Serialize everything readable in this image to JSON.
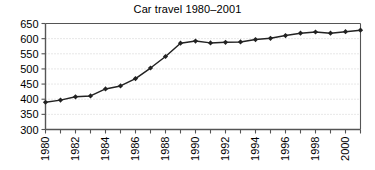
{
  "chart_data": {
    "type": "line",
    "title": "Car travel 1980–2001",
    "xlabel": "",
    "ylabel": "",
    "grid": true,
    "legend": "none",
    "xlim": [
      1980,
      2001
    ],
    "ylim": [
      300,
      650
    ],
    "ytick_labels": [
      "650",
      "600",
      "550",
      "500",
      "450",
      "400",
      "350",
      "300"
    ],
    "ytick_values": [
      650,
      600,
      550,
      500,
      450,
      400,
      350,
      300
    ],
    "xtick_values": [
      1980,
      1981,
      1982,
      1983,
      1984,
      1985,
      1986,
      1987,
      1988,
      1989,
      1990,
      1991,
      1992,
      1993,
      1994,
      1995,
      1996,
      1997,
      1998,
      1999,
      2000,
      2001
    ],
    "xtick_labels": [
      "1980",
      "",
      "1982",
      "",
      "1984",
      "",
      "1986",
      "",
      "1988",
      "",
      "1990",
      "",
      "1992",
      "",
      "1994",
      "",
      "1996",
      "",
      "1998",
      "",
      "2000",
      ""
    ],
    "series": [
      {
        "name": "Car travel",
        "marker": "diamond",
        "color": "#222222",
        "x": [
          1980,
          1981,
          1982,
          1983,
          1984,
          1985,
          1986,
          1987,
          1988,
          1989,
          1990,
          1991,
          1992,
          1993,
          1994,
          1995,
          1996,
          1997,
          1998,
          1999,
          2000,
          2001
        ],
        "values": [
          390,
          397,
          408,
          411,
          434,
          444,
          468,
          503,
          541,
          585,
          592,
          586,
          588,
          589,
          597,
          601,
          610,
          618,
          622,
          618,
          623,
          628
        ]
      }
    ]
  },
  "figure": {
    "background_color": "#ffffff",
    "axis_color": "#555555",
    "grid_color": "#cfcfcf",
    "line_color": "#222222"
  }
}
